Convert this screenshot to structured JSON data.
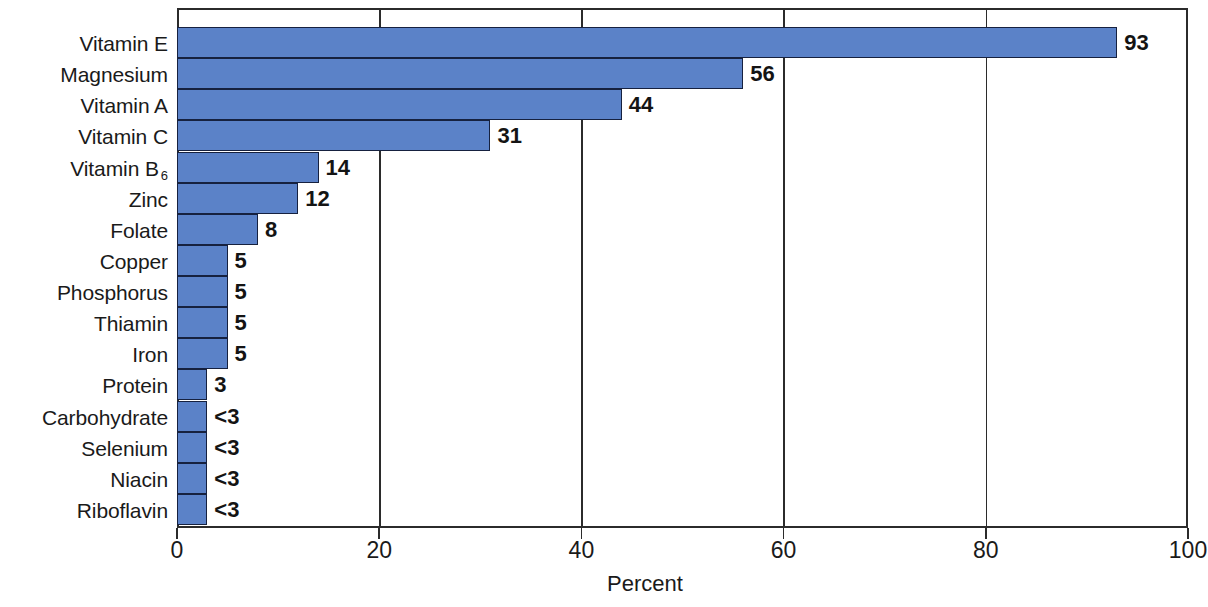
{
  "chart_data": {
    "type": "bar",
    "orientation": "horizontal",
    "title": "",
    "subtitle": "",
    "xlabel": "Percent",
    "ylabel": "",
    "xlim": [
      0,
      100
    ],
    "xticks": [
      0,
      20,
      40,
      60,
      80,
      100
    ],
    "xtick_labels": [
      "0",
      "20",
      "40",
      "60",
      "80",
      "100"
    ],
    "grid": "vertical",
    "legend": "none",
    "bar_color": "#5b82c8",
    "bar_edge_color": "#16213f",
    "categories": [
      "Vitamin E",
      "Magnesium",
      "Vitamin A",
      "Vitamin C",
      "Vitamin B6",
      "Zinc",
      "Folate",
      "Copper",
      "Phosphorus",
      "Thiamin",
      "Iron",
      "Protein",
      "Carbohydrate",
      "Selenium",
      "Niacin",
      "Riboflavin"
    ],
    "values": [
      93,
      56,
      44,
      31,
      14,
      12,
      8,
      5,
      5,
      5,
      5,
      3,
      3,
      3,
      3,
      3
    ],
    "value_labels": [
      "93",
      "56",
      "44",
      "31",
      "14",
      "12",
      "8",
      "5",
      "5",
      "5",
      "5",
      "3",
      "<3",
      "<3",
      "<3",
      "<3"
    ],
    "bars": [
      {
        "category": "Vitamin E",
        "category_html": "Vitamin E",
        "value": 93,
        "label": "93"
      },
      {
        "category": "Magnesium",
        "category_html": "Magnesium",
        "value": 56,
        "label": "56"
      },
      {
        "category": "Vitamin A",
        "category_html": "Vitamin A",
        "value": 44,
        "label": "44"
      },
      {
        "category": "Vitamin C",
        "category_html": "Vitamin C",
        "value": 31,
        "label": "31"
      },
      {
        "category": "Vitamin B6",
        "category_html": "Vitamin B<sub>6</sub>",
        "value": 14,
        "label": "14"
      },
      {
        "category": "Zinc",
        "category_html": "Zinc",
        "value": 12,
        "label": "12"
      },
      {
        "category": "Folate",
        "category_html": "Folate",
        "value": 8,
        "label": "8"
      },
      {
        "category": "Copper",
        "category_html": "Copper",
        "value": 5,
        "label": "5"
      },
      {
        "category": "Phosphorus",
        "category_html": "Phosphorus",
        "value": 5,
        "label": "5"
      },
      {
        "category": "Thiamin",
        "category_html": "Thiamin",
        "value": 5,
        "label": "5"
      },
      {
        "category": "Iron",
        "category_html": "Iron",
        "value": 5,
        "label": "5"
      },
      {
        "category": "Protein",
        "category_html": "Protein",
        "value": 3,
        "label": "3"
      },
      {
        "category": "Carbohydrate",
        "category_html": "Carbohydrate",
        "value": 3,
        "label": "&lt;3"
      },
      {
        "category": "Selenium",
        "category_html": "Selenium",
        "value": 3,
        "label": "&lt;3"
      },
      {
        "category": "Niacin",
        "category_html": "Niacin",
        "value": 3,
        "label": "&lt;3"
      },
      {
        "category": "Riboflavin",
        "category_html": "Riboflavin",
        "value": 3,
        "label": "&lt;3"
      }
    ]
  }
}
